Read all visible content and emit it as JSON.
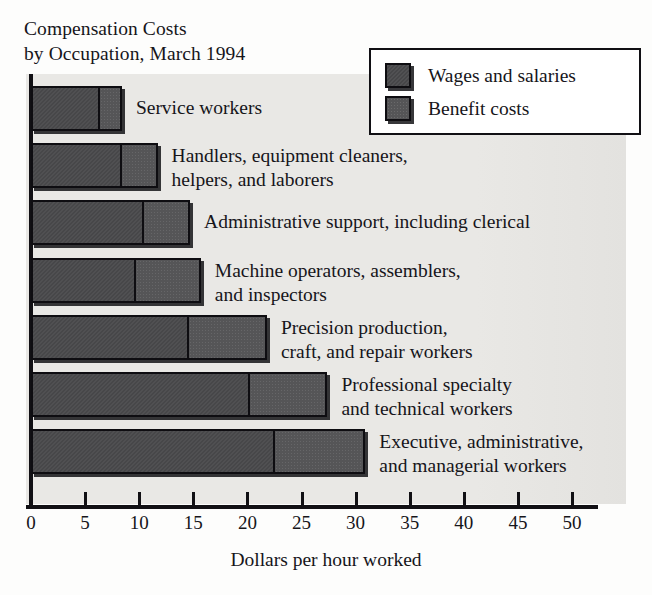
{
  "chart_data": {
    "type": "bar",
    "orientation": "horizontal",
    "stacked": true,
    "title": "Compensation Costs by Occupation, March 1994",
    "title_lines": [
      "Compensation Costs",
      "by Occupation, March 1994"
    ],
    "xlabel": "Dollars per hour worked",
    "ylabel": "",
    "xlim": [
      0,
      52.8
    ],
    "xticks": [
      0,
      5,
      10,
      15,
      20,
      25,
      30,
      35,
      40,
      45,
      50
    ],
    "xtick_labels": [
      "0",
      "5",
      "10",
      "15",
      "20",
      "25",
      "30",
      "35",
      "40",
      "45",
      "50"
    ],
    "grid": false,
    "legend_position": "top-right",
    "categories": [
      "Service workers",
      "Handlers, equipment cleaners, helpers, and laborers",
      "Administrative support, including clerical",
      "Machine operators, assemblers, and inspectors",
      "Precision production, craft, and repair workers",
      "Professional specialty and technical workers",
      "Executive, administrative, and managerial workers"
    ],
    "category_label_lines": [
      [
        "Service workers"
      ],
      [
        "Handlers, equipment cleaners,",
        "helpers, and laborers"
      ],
      [
        "Administrative support, including clerical"
      ],
      [
        "Machine operators, assemblers,",
        "and inspectors"
      ],
      [
        "Precision production,",
        "craft, and repair workers"
      ],
      [
        "Professional specialty",
        "and technical workers"
      ],
      [
        "Executive, administrative,",
        "and managerial workers"
      ]
    ],
    "series": [
      {
        "name": "Wages and salaries",
        "color": "#4a4a4c",
        "values": [
          6.0,
          8.0,
          10.1,
          9.3,
          14.2,
          19.9,
          22.2
        ]
      },
      {
        "name": "Benefit costs",
        "color": "#555557",
        "values": [
          2.4,
          3.7,
          4.6,
          6.4,
          7.6,
          7.5,
          8.7
        ]
      }
    ],
    "totals": [
      8.4,
      11.7,
      14.7,
      15.7,
      21.8,
      27.4,
      30.9
    ]
  },
  "legend": {
    "items": [
      {
        "label": "Wages and salaries",
        "swatch": "wages"
      },
      {
        "label": "Benefit costs",
        "swatch": "benefits"
      }
    ]
  },
  "colors": {
    "page_background": "#fdfdfc",
    "plot_background": "#e9e8e5",
    "axis": "#111014",
    "text": "#16151a",
    "wages": "#4a4a4c",
    "benefits": "#555557",
    "legend_background": "#ffffff"
  }
}
